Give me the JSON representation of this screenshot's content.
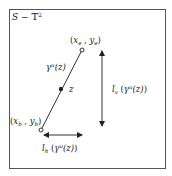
{
  "diagram": {
    "title_parts": {
      "S": "S",
      "minus": " − ",
      "T": "𝕋",
      "sup": "2"
    },
    "colors": {
      "line": "#333333",
      "frame": "#555555",
      "text": "#222222",
      "background": "#ffffff"
    },
    "frame": {
      "x": 9,
      "y": 9,
      "width": 156,
      "height": 159
    },
    "points": {
      "end": {
        "label": "(x_e , y_e)",
        "label_x": "x",
        "label_xsub": "e",
        "label_y": "y",
        "label_ysub": "e",
        "cx": 82,
        "cy": 50,
        "style": "open-circle"
      },
      "begin": {
        "label": "(x_b , y_b)",
        "label_x": "x",
        "label_xsub": "b",
        "label_y": "y",
        "label_ysub": "b",
        "cx": 41,
        "cy": 130,
        "style": "open-circle"
      },
      "z": {
        "label": "z",
        "cx": 61,
        "cy": 89,
        "style": "filled-dot"
      }
    },
    "curve_label": {
      "gamma": "γ",
      "sup": "u",
      "arg": "(z)"
    },
    "vertical_length": {
      "l": "l",
      "sub": "v",
      "gamma": "γ",
      "sup": "u",
      "arg": "(z)",
      "x": 102,
      "y1": 50,
      "y2": 126
    },
    "horizontal_length": {
      "l": "l",
      "sub": "h",
      "gamma": "γ",
      "sup": "u",
      "arg": "(z)",
      "y": 135,
      "x1": 44,
      "x2": 82
    }
  }
}
